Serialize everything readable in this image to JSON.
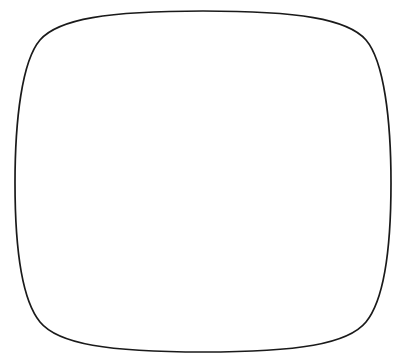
{
  "figure": {
    "title": "",
    "style": "hand-drawn line illustration",
    "frame": {
      "name": "rounded-squircle-border",
      "stroke_color": "#1a1a1a",
      "stroke_width": 1.6,
      "fill": "#ffffff"
    },
    "ground": {
      "name": "horizon-line",
      "description": "single horizontal ground/horizon line crossing behind the bars",
      "stroke_color": "#1a1a1a",
      "left_point": [
        33,
        297
      ],
      "right_point": [
        392,
        272
      ]
    }
  },
  "chart_data": {
    "type": "bar",
    "subtype": "stacked-bar-3d-isometric",
    "title": "",
    "xlabel": "",
    "ylabel": "",
    "categories": [
      "Bar 1",
      "Bar 2",
      "Bar 3",
      "Bar 4"
    ],
    "unit": "blocks",
    "ylim": [
      0,
      13
    ],
    "grid": false,
    "legend": "none",
    "axis_ticks": [],
    "tick_labels": [],
    "segment_types": [
      {
        "key": "diagonal",
        "label": "Diagonal hatch",
        "pattern": "diagonal-hatch",
        "color": "#1a1a1a"
      },
      {
        "key": "vertical",
        "label": "Vertical lines",
        "pattern": "vertical-lines",
        "color": "#1a1a1a"
      },
      {
        "key": "blank",
        "label": "Blank / white",
        "pattern": "solid-white",
        "color": "#ffffff"
      },
      {
        "key": "dotted",
        "label": "Stippled dots",
        "pattern": "stipple-dots",
        "color": "#1a1a1a"
      }
    ],
    "series": [
      {
        "name": "Diagonal hatch",
        "key": "diagonal",
        "values": [
          4,
          1,
          2,
          3
        ]
      },
      {
        "name": "Vertical lines",
        "key": "vertical",
        "values": [
          2,
          3,
          2,
          4
        ]
      },
      {
        "name": "Blank / white",
        "key": "blank",
        "values": [
          2,
          4,
          2,
          2
        ]
      },
      {
        "name": "Stippled dots",
        "key": "dotted",
        "values": [
          4,
          1,
          4,
          4
        ]
      }
    ],
    "totals": [
      12,
      9,
      10,
      13
    ],
    "values": [
      12,
      9,
      10,
      13
    ]
  },
  "bars": [
    {
      "id": "bar-1",
      "label": "Bar 1",
      "total_blocks": 12,
      "studs": 3,
      "front_x": 93,
      "front_width": 40,
      "top_y": 67,
      "bottom_y": 299,
      "block_height": 19.3,
      "segments": [
        {
          "type": "diagonal",
          "blocks": 4
        },
        {
          "type": "vertical",
          "blocks": 2
        },
        {
          "type": "blank",
          "blocks": 2
        },
        {
          "type": "dotted",
          "blocks": 4
        }
      ]
    },
    {
      "id": "bar-2",
      "label": "Bar 2",
      "total_blocks": 9,
      "studs": 3,
      "front_x": 154,
      "front_width": 39,
      "top_y": 106,
      "bottom_y": 300,
      "block_height": 21.5,
      "segments": [
        {
          "type": "diagonal",
          "blocks": 1
        },
        {
          "type": "vertical",
          "blocks": 3
        },
        {
          "type": "blank",
          "blocks": 4
        },
        {
          "type": "dotted",
          "blocks": 1
        }
      ]
    },
    {
      "id": "bar-3",
      "label": "Bar 3",
      "total_blocks": 10,
      "studs": 3,
      "front_x": 215,
      "front_width": 39,
      "top_y": 123,
      "bottom_y": 311,
      "block_height": 18.8,
      "segments": [
        {
          "type": "diagonal",
          "blocks": 2
        },
        {
          "type": "vertical",
          "blocks": 2
        },
        {
          "type": "blank",
          "blocks": 2
        },
        {
          "type": "dotted",
          "blocks": 4
        }
      ]
    },
    {
      "id": "bar-4",
      "label": "Bar 4",
      "total_blocks": 13,
      "studs": 3,
      "front_x": 285,
      "front_width": 40,
      "top_y": 48,
      "bottom_y": 313,
      "block_height": 20.4,
      "segments": [
        {
          "type": "diagonal",
          "blocks": 3
        },
        {
          "type": "vertical",
          "blocks": 4
        },
        {
          "type": "blank",
          "blocks": 2
        },
        {
          "type": "dotted",
          "blocks": 4
        }
      ]
    }
  ],
  "render": {
    "depth_x": 8,
    "depth_y": -9,
    "stroke_color": "#1a1a1a",
    "fill_color": "#ffffff",
    "side_tone": "#f2f2f2"
  }
}
